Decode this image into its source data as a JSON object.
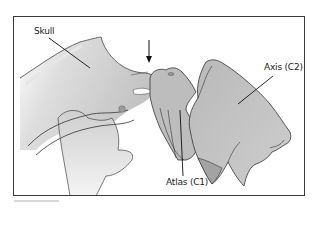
{
  "figure": {
    "labels": {
      "skull": "Skull",
      "axis": "Axis (C2)",
      "atlas": "Atlas (C1)"
    },
    "indicators": {
      "arrow": "down-arrow pointing to atlanto-occipital junction"
    },
    "colors": {
      "bone_fill": "#c4c4c4",
      "bone_fill_light": "#d9d9d9",
      "atlas_fill": "#a8a8a8",
      "outline": "#333333",
      "frame": "#3a3a3a",
      "background": "#ffffff"
    }
  }
}
